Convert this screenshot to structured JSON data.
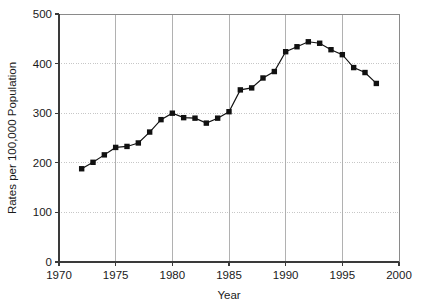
{
  "chart_data": {
    "type": "line",
    "title": "",
    "xlabel": "Year",
    "ylabel": "Rates per 100,000 Population",
    "xlim": [
      1970,
      2000
    ],
    "ylim": [
      0,
      500
    ],
    "xticks": [
      1970,
      1975,
      1980,
      1985,
      1990,
      1995,
      2000
    ],
    "xtick_labels": [
      "1970",
      "1975",
      "1980",
      "1985",
      "1990",
      "1995",
      "2000"
    ],
    "yticks": [
      0,
      100,
      200,
      300,
      400,
      500
    ],
    "ytick_labels": [
      "0",
      "100",
      "200",
      "300",
      "400",
      "500"
    ],
    "grid": true,
    "grid_axes": "both",
    "legend": "none",
    "marker": "square",
    "marker_color": "#111111",
    "line_color": "#111111",
    "x": [
      1972,
      1973,
      1974,
      1975,
      1976,
      1977,
      1978,
      1979,
      1980,
      1981,
      1982,
      1983,
      1984,
      1985,
      1986,
      1987,
      1988,
      1989,
      1990,
      1991,
      1992,
      1993,
      1994,
      1995,
      1996,
      1997,
      1998
    ],
    "values": [
      188,
      201,
      216,
      231,
      233,
      240,
      262,
      287,
      300,
      291,
      290,
      280,
      290,
      303,
      347,
      351,
      371,
      384,
      424,
      434,
      444,
      441,
      428,
      418,
      392,
      382,
      360
    ]
  },
  "axis": {
    "y_title": "Rates per 100,000 Population",
    "x_title": "Year"
  }
}
